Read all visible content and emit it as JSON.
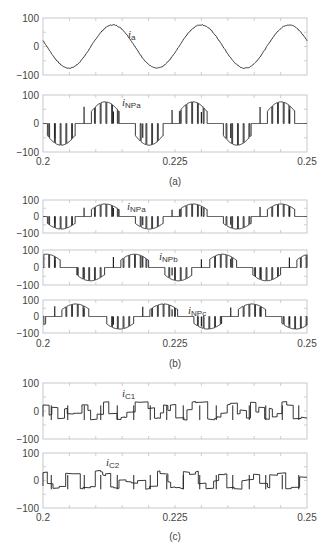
{
  "chart_data": [
    {
      "panel": "(a)",
      "type": "line",
      "caption": "(a)",
      "x_ticks": [
        "0.2",
        "0.225",
        "0.25"
      ],
      "xlim": [
        0.2,
        0.25
      ],
      "subplots": [
        {
          "label": "i",
          "subscript": "a",
          "y_ticks": [
            "100",
            "0",
            "-100"
          ],
          "ylim": [
            -100,
            100
          ],
          "description": "sinusoidal phase current, amplitude ~75, 3 cycles (period ~0.0167s), starts near -20 at 0.2",
          "peaks": [
            {
              "x": 0.2115,
              "y": 75
            },
            {
              "x": 0.228,
              "y": 76
            },
            {
              "x": 0.2448,
              "y": 76
            }
          ],
          "troughs": [
            {
              "x": 0.2035,
              "y": -75
            },
            {
              "x": 0.22,
              "y": -76
            },
            {
              "x": 0.2365,
              "y": -75
            }
          ]
        },
        {
          "label": "i",
          "subscript": "NPa",
          "y_ticks": [
            "100",
            "0",
            "-100"
          ],
          "ylim": [
            -100,
            100
          ],
          "description": "neutral point current of phase a: pulsed segments following the sine envelope with zero intervals, spikes up to ~+75 and down to ~-75"
        }
      ]
    },
    {
      "panel": "(b)",
      "type": "line",
      "caption": "(b)",
      "x_ticks": [
        "0.2",
        "0.225",
        "0.25"
      ],
      "xlim": [
        0.2,
        0.25
      ],
      "subplots": [
        {
          "label": "i",
          "subscript": "NPa",
          "y_ticks": [
            "100",
            "0",
            "-100"
          ],
          "ylim": [
            -100,
            100
          ]
        },
        {
          "label": "i",
          "subscript": "NPb",
          "y_ticks": [
            "100",
            "0",
            "-100"
          ],
          "ylim": [
            -100,
            100
          ]
        },
        {
          "label": "i",
          "subscript": "NPc",
          "y_ticks": [
            "100",
            "0",
            "-100"
          ],
          "ylim": [
            -100,
            100
          ]
        }
      ]
    },
    {
      "panel": "(c)",
      "type": "line",
      "caption": "(c)",
      "x_ticks": [
        "0.2",
        "0.225",
        "0.25"
      ],
      "xlim": [
        0.2,
        0.25
      ],
      "subplots": [
        {
          "label": "i",
          "subscript": "C1",
          "y_ticks": [
            "100",
            "0",
            "-100"
          ],
          "ylim": [
            -100,
            100
          ],
          "description": "capacitor current, square-ish switching ripple between ~-30 and ~+35"
        },
        {
          "label": "i",
          "subscript": "C2",
          "y_ticks": [
            "100",
            "0",
            "-100"
          ],
          "ylim": [
            -100,
            100
          ],
          "description": "capacitor current, square-ish switching ripple between ~-35 and ~+35"
        }
      ]
    }
  ],
  "labels": {
    "ia": "i",
    "ia_sub": "a",
    "inpa": "i",
    "inpa_sub": "NPa",
    "inpb": "i",
    "inpb_sub": "NPb",
    "inpc": "i",
    "inpc_sub": "NPc",
    "ic1": "i",
    "ic1_sub": "C1",
    "ic2": "i",
    "ic2_sub": "C2"
  },
  "ticks": {
    "y_top": "100",
    "y_mid": "0",
    "y_bot": "−100",
    "x0": "0.2",
    "x1": "0.225",
    "x2": "0.25"
  },
  "captions": {
    "a": "(a)",
    "b": "(b)",
    "c": "(c)"
  }
}
